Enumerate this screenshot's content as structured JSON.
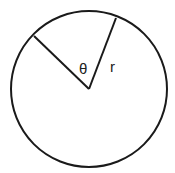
{
  "diagram": {
    "stroke_color": "#1a1a1a",
    "background": "#ffffff",
    "circle": {
      "cx": 89,
      "cy": 89,
      "r": 78
    },
    "radius_lines": [
      {
        "name": "left-radius",
        "x1": 89,
        "y1": 89,
        "x2": 34,
        "y2": 36
      },
      {
        "name": "right-radius",
        "x1": 89,
        "y1": 89,
        "x2": 116,
        "y2": 18
      }
    ],
    "labels": {
      "angle": "θ",
      "radius": "r"
    }
  }
}
